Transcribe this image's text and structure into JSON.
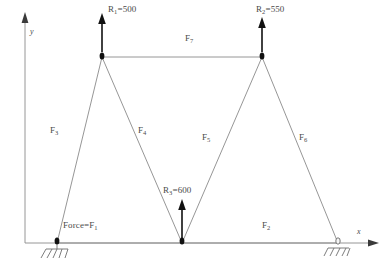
{
  "diagram": {
    "colors": {
      "member": "#8a8a8a",
      "ground_line": "#8a8a8a",
      "axis": "#8a8a8a",
      "arrow": "#1a1a1a",
      "node": "#111111",
      "text": "#4a4a4a",
      "background": "#ffffff"
    },
    "axes": {
      "y_label": "y",
      "x_label": "x"
    },
    "nodes": [
      {
        "id": "A",
        "x": 57,
        "y": 243,
        "support": "pin"
      },
      {
        "id": "B",
        "x": 102,
        "y": 57,
        "support": "none"
      },
      {
        "id": "C",
        "x": 182,
        "y": 243,
        "support": "none"
      },
      {
        "id": "D",
        "x": 262,
        "y": 57,
        "support": "none"
      },
      {
        "id": "E",
        "x": 338,
        "y": 243,
        "support": "roller"
      }
    ],
    "members": [
      {
        "name": "F1",
        "label": "Force=F",
        "sub": "1",
        "from": "A",
        "to": "C"
      },
      {
        "name": "F2",
        "label": "F",
        "sub": "2",
        "from": "C",
        "to": "E"
      },
      {
        "name": "F3",
        "label": "F",
        "sub": "3",
        "from": "A",
        "to": "B"
      },
      {
        "name": "F4",
        "label": "F",
        "sub": "4",
        "from": "B",
        "to": "C"
      },
      {
        "name": "F5",
        "label": "F",
        "sub": "5",
        "from": "C",
        "to": "D"
      },
      {
        "name": "F6",
        "label": "F",
        "sub": "6",
        "from": "D",
        "to": "E"
      },
      {
        "name": "F7",
        "label": "F",
        "sub": "7",
        "from": "B",
        "to": "D"
      }
    ],
    "loads": [
      {
        "name": "R1",
        "symbol": "R",
        "sub": "1",
        "equals": "=500",
        "value": 500,
        "at_node": "B",
        "direction": "up"
      },
      {
        "name": "R2",
        "symbol": "R",
        "sub": "2",
        "equals": "=550",
        "value": 550,
        "at_node": "D",
        "direction": "up"
      },
      {
        "name": "R3",
        "symbol": "R",
        "sub": "3",
        "equals": "=600",
        "value": 600,
        "at_node": "C",
        "direction": "up"
      }
    ]
  }
}
